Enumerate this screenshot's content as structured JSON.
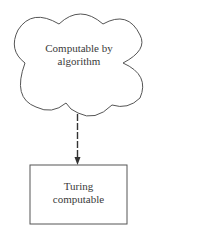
{
  "diagram": {
    "nodes": [
      {
        "id": "cloud",
        "shape": "cloud",
        "lines": [
          "Computable by",
          "algorithm"
        ]
      },
      {
        "id": "box",
        "shape": "rectangle",
        "lines": [
          "Turing",
          "computable"
        ]
      }
    ],
    "edges": [
      {
        "from": "cloud",
        "to": "box",
        "style": "dashed",
        "arrowhead": "filled"
      }
    ],
    "colors": {
      "stroke": "#555555",
      "text": "#3a3a3a",
      "background": "#ffffff"
    }
  }
}
